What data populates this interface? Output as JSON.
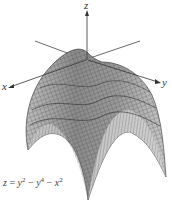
{
  "figure": {
    "type": "3d-surface-plot",
    "axes": {
      "x_label": "x",
      "y_label": "y",
      "z_label": "z"
    },
    "equation": {
      "lhs": "z",
      "eq": " = ",
      "t1": "y",
      "t1_exp": "2",
      "op1": " − ",
      "t2": "y",
      "t2_exp": "4",
      "op2": " − ",
      "t3": "x",
      "t3_exp": "2"
    },
    "colors": {
      "surface_light": "#d9d9d9",
      "surface_dark": "#6e6e6e",
      "mesh": "#3a3a3a",
      "axis": "#444444"
    }
  }
}
